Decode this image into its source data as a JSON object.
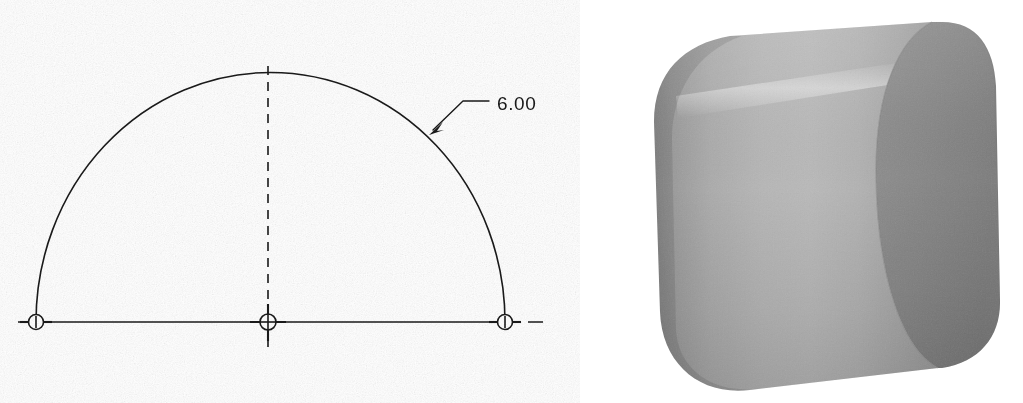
{
  "document": {
    "title": "Semicircular Extrusion — Sketch and Shaded Model",
    "background_color": "#ffffff",
    "line_color": "#1a1a1a"
  },
  "sketch": {
    "name": "half-circle-profile-sketch",
    "dimension_label": "6.00",
    "dimension_units": "inches",
    "dimension_type": "diameter",
    "geometry_description": "Semicircular arc closed by a horizontal chord, with center point and two arc endpoints marked.",
    "arc": {
      "center_x": 268,
      "center_y": 322,
      "radius_x": 234,
      "radius_y": 249,
      "start_angle_deg": 180,
      "end_angle_deg": 0
    },
    "points": [
      {
        "name": "arc-endpoint-left",
        "x": 36,
        "y": 322,
        "marker": "circle-with-tick"
      },
      {
        "name": "arc-center-point",
        "x": 268,
        "y": 322,
        "marker": "circle-with-cross"
      },
      {
        "name": "arc-endpoint-right",
        "x": 505,
        "y": 322,
        "marker": "circle-with-tick"
      }
    ],
    "centerlines": [
      {
        "name": "horizontal-centerline",
        "orientation": "horizontal",
        "style": "solid",
        "x1": 18,
        "y1": 322,
        "x2": 540,
        "y2": 322
      },
      {
        "name": "vertical-centerline",
        "orientation": "vertical",
        "style": "dashed",
        "x1": 268,
        "y1": 66,
        "x2": 268,
        "y2": 350
      }
    ],
    "leader": {
      "name": "diameter-leader",
      "arrow_x": 432,
      "arrow_y": 131,
      "elbow_x": 463,
      "elbow_y": 101,
      "shoulder_x": 487,
      "shoulder_y": 101,
      "text_x": 497,
      "text_y": 110
    }
  },
  "model": {
    "name": "half-cylinder-3d-model",
    "description": "Shaded isometric view of a half-cylinder (semicircular profile extruded), rendered in grayscale with a dithered halftone texture.",
    "render_style": "shaded-grayscale",
    "colors": {
      "curved_face_light": "#b4b4b4",
      "curved_face_mid": "#a0a0a0",
      "curved_face_dark": "#8e8e8e",
      "end_cap_face": "#8a8a8a",
      "end_cap_face_dark": "#7e7e7e",
      "highlight_band": "#c2c2c2",
      "silhouette_edge": "#7a7a7a"
    },
    "faces": [
      {
        "name": "curved-cylindrical-face",
        "shading": "gradient-left-dark-to-center-light"
      },
      {
        "name": "semicircular-end-cap-face",
        "shading": "flat-dark-gray"
      },
      {
        "name": "flat-rectangular-base-face",
        "shading": "hidden-from-view"
      }
    ]
  }
}
